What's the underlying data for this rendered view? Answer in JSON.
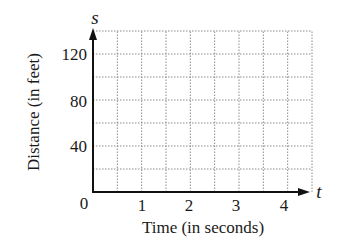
{
  "chart_data": {
    "type": "line",
    "title": "",
    "xlabel": "Time (in seconds)",
    "ylabel": "Distance (in feet)",
    "x_var": "t",
    "y_var": "s",
    "xlim": [
      0,
      4.5
    ],
    "ylim": [
      0,
      140
    ],
    "x_ticks": [
      1,
      2,
      3,
      4
    ],
    "x_tick_labels": [
      "1",
      "2",
      "3",
      "4"
    ],
    "y_ticks": [
      40,
      80,
      120
    ],
    "y_tick_labels": [
      "40",
      "80",
      "120"
    ],
    "origin_label": "0",
    "grid": true,
    "grid_x_step": 0.5,
    "grid_y_step": 20,
    "grid_style": "dotted",
    "series": [],
    "legend": null
  },
  "labels": {
    "xlabel": "Time (in seconds)",
    "ylabel": "Distance (in feet)",
    "x_var": "t",
    "y_var": "s",
    "origin": "0",
    "x_ticks": [
      "1",
      "2",
      "3",
      "4"
    ],
    "y_ticks": [
      "40",
      "80",
      "120"
    ]
  },
  "colors": {
    "axis": "#111111",
    "grid": "#8a8a8a",
    "text": "#1a1a1a",
    "background": "#ffffff"
  }
}
